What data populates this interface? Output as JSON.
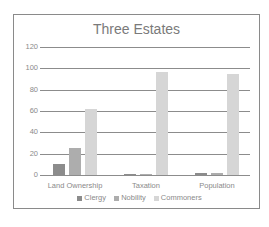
{
  "chart_data": {
    "type": "bar",
    "title": "Three Estates",
    "categories": [
      "Land Ownership",
      "Taxation",
      "Population"
    ],
    "series": [
      {
        "name": "Clergy",
        "values": [
          10,
          0.5,
          1.5
        ],
        "color": "#8c8c8c"
      },
      {
        "name": "Nobility",
        "values": [
          25,
          0.5,
          1.5
        ],
        "color": "#adadad"
      },
      {
        "name": "Commoners",
        "values": [
          62,
          97,
          95
        ],
        "color": "#d6d6d6"
      }
    ],
    "xlabel": "",
    "ylabel": "",
    "ylim": [
      0,
      120
    ],
    "yticks": [
      "0",
      "20",
      "40",
      "60",
      "80",
      "100",
      "120"
    ],
    "grid": true,
    "legend_position": "bottom"
  }
}
